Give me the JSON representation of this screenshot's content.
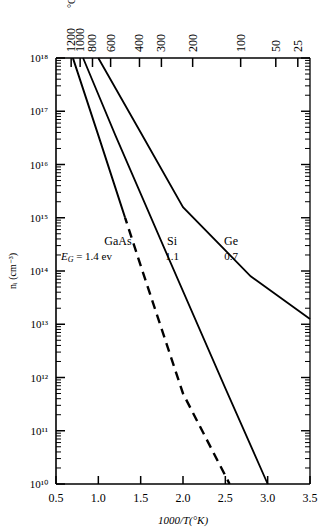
{
  "chart_data": {
    "type": "line",
    "title": "",
    "xlabel": "1000/T(°K)",
    "ylabel": "nᵢ (cm⁻³)",
    "xlim": [
      0.5,
      3.5
    ],
    "ylim_exp": [
      10,
      18
    ],
    "yscale": "log",
    "grid": false,
    "legend": "inline-labels",
    "x_ticks": [
      "0.5",
      "1.0",
      "1.5",
      "2.0",
      "2.5",
      "3.0",
      "3.5"
    ],
    "y_ticks": [
      "10¹⁸",
      "10¹⁷",
      "10¹⁶",
      "10¹⁵",
      "10¹⁴",
      "10¹³",
      "10¹²",
      "10¹¹",
      "10¹⁰"
    ],
    "y_tick_exponents": [
      18,
      17,
      16,
      15,
      14,
      13,
      12,
      11,
      10
    ],
    "top_axis": {
      "unit": "°C",
      "ticks": [
        {
          "label": "1200",
          "x": 0.679
        },
        {
          "label": "1000",
          "x": 0.785
        },
        {
          "label": "800",
          "x": 0.931
        },
        {
          "label": "600",
          "x": 1.145
        },
        {
          "label": "400",
          "x": 1.486
        },
        {
          "label": "300",
          "x": 1.745
        },
        {
          "label": "200",
          "x": 2.114
        },
        {
          "label": "100",
          "x": 2.681
        },
        {
          "label": "50",
          "x": 3.096
        },
        {
          "label": "25",
          "x": 3.356
        }
      ]
    },
    "series": [
      {
        "name": "GaAs",
        "label": "GaAs",
        "gap_label": "E_G = 1.4 ev",
        "bandgap_ev": 1.4,
        "style": "solid-then-dashed",
        "dash_begins_exp": 15.0,
        "points": [
          [
            0.7,
            18.0
          ],
          [
            1.0,
            16.55
          ],
          [
            1.5,
            14.1
          ],
          [
            2.0,
            11.7
          ],
          [
            2.55,
            10.0
          ]
        ]
      },
      {
        "name": "Si",
        "label": "Si",
        "gap_label": "1.1",
        "bandgap_ev": 1.1,
        "style": "solid",
        "points": [
          [
            0.82,
            18.0
          ],
          [
            1.2,
            16.55
          ],
          [
            1.8,
            14.35
          ],
          [
            2.5,
            11.8
          ],
          [
            3.0,
            10.0
          ]
        ]
      },
      {
        "name": "Ge",
        "label": "Ge",
        "gap_label": "0.7",
        "bandgap_ev": 0.7,
        "style": "solid",
        "points": [
          [
            1.0,
            18.0
          ],
          [
            1.5,
            16.6
          ],
          [
            2.0,
            15.2
          ],
          [
            2.8,
            13.9
          ],
          [
            3.5,
            13.1
          ]
        ]
      }
    ]
  }
}
